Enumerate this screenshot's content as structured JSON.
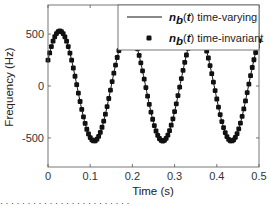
{
  "chart_data": {
    "type": "line",
    "title": "",
    "xlabel": "Time (s)",
    "ylabel": "Frequency (Hz)",
    "xlim": [
      0,
      0.5
    ],
    "ylim": [
      -780,
      780
    ],
    "xticks": [
      0,
      0.1,
      0.2,
      0.3,
      0.4,
      0.5
    ],
    "xtick_labels": [
      "0",
      "0.1",
      "0.2",
      "0.3",
      "0.4",
      "0.5"
    ],
    "yticks": [
      -500,
      0,
      500
    ],
    "ytick_labels": [
      "-500",
      "0",
      "500"
    ],
    "grid": false,
    "legend_position": "upper right",
    "model": {
      "form": "amplitude*sin(2*pi*freq*t + phase)",
      "amplitude": 530,
      "freq": 6.15,
      "phase": 0.49
    },
    "series": [
      {
        "name": "n_b(t) time-varying",
        "style": "line",
        "color": "#111111",
        "x": [
          0,
          0.028,
          0.069,
          0.111,
          0.151,
          0.191,
          0.232,
          0.273,
          0.313,
          0.354,
          0.395,
          0.436,
          0.476,
          0.5
        ],
        "y": [
          250,
          530,
          0,
          -530,
          0,
          530,
          0,
          -530,
          0,
          530,
          0,
          -530,
          0,
          300
        ]
      },
      {
        "name": "n_b(t) time-invariant",
        "style": "markers",
        "marker": "square",
        "color": "#111111",
        "x": [
          0,
          0.028,
          0.069,
          0.111,
          0.151,
          0.191,
          0.232,
          0.273,
          0.313,
          0.354,
          0.395,
          0.436,
          0.476,
          0.5
        ],
        "y": [
          250,
          530,
          0,
          -530,
          0,
          530,
          0,
          -530,
          0,
          530,
          0,
          -530,
          0,
          300
        ]
      }
    ]
  },
  "legend": {
    "items": [
      {
        "symbol": "n",
        "sub": "b",
        "arg": "(t)",
        "text": " time-varying"
      },
      {
        "symbol": "n",
        "sub": "b",
        "arg": "(t)",
        "text": " time-invariant"
      }
    ]
  },
  "caption": "·  ·  ·  ·  ·  ·  ·  ·  ·  ·  ·  ·  ·  ·  ·  ·  ·  ·  ·  ·  ·  ·  ·  ·"
}
